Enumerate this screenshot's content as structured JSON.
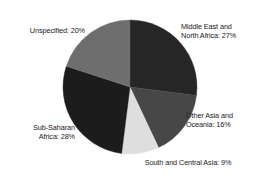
{
  "chart_data": {
    "type": "pie",
    "title": "",
    "subtitle": "",
    "xlabel": "",
    "ylabel": "",
    "legend_position": "none",
    "grid": false,
    "start_angle_deg": 0,
    "direction": "clockwise",
    "units": "percent",
    "total": 100,
    "categories": [
      "Middle East and North Africa",
      "Other Asia and Oceania",
      "South and Central Asia",
      "Sub-Saharan Africa",
      "Unspecified"
    ],
    "values": [
      27,
      16,
      9,
      28,
      20
    ],
    "colors": [
      "#262626",
      "#474747",
      "#dedede",
      "#1c1c1c",
      "#6e6e6e"
    ],
    "slices": [
      {
        "name": "Middle East and North Africa",
        "value": 27,
        "color": "#262626",
        "label_text": "Middle East and\nNorth Africa: 27%",
        "label_position": "right-top"
      },
      {
        "name": "Other Asia and Oceania",
        "value": 16,
        "color": "#474747",
        "label_text": "Other Asia and\nOceania: 16%",
        "label_position": "right-bottom"
      },
      {
        "name": "South and Central Asia",
        "value": 9,
        "color": "#dedede",
        "label_text": "South and Central Asia: 9%",
        "label_position": "bottom-center"
      },
      {
        "name": "Sub-Saharan Africa",
        "value": 28,
        "color": "#1c1c1c",
        "label_text": "Sub-Saharan\nAfrica: 28%",
        "label_position": "left-bottom"
      },
      {
        "name": "Unspecified",
        "value": 20,
        "color": "#6e6e6e",
        "label_text": "Unspecified: 20%",
        "label_position": "left-top"
      }
    ]
  },
  "figure": {
    "background": "#ffffff",
    "center_x": 130,
    "center_y": 87,
    "radius": 67
  }
}
